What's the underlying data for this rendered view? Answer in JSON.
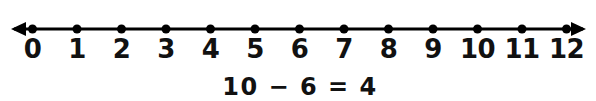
{
  "canvas": {
    "width": 596,
    "height": 101,
    "background": "#ffffff",
    "ink": "#000000"
  },
  "number_line": {
    "name": "number-line",
    "orientation": "horizontal",
    "has_left_arrow": true,
    "has_right_arrow": true,
    "min": 0,
    "max": 12,
    "step": 1,
    "tick_labels": [
      "0",
      "1",
      "2",
      "3",
      "4",
      "5",
      "6",
      "7",
      "8",
      "9",
      "10",
      "11",
      "12"
    ],
    "marked_points": [
      0,
      1,
      2,
      3,
      4,
      5,
      6,
      7,
      8,
      9,
      10,
      11,
      12
    ],
    "geometry": {
      "line_y": 29,
      "left_arrow_tip_x": 11,
      "right_arrow_tip_x": 586,
      "first_dot_x": 32.5,
      "spacing_px": 44.5,
      "dot_radius": 4.5,
      "label_baseline_y": 58
    }
  },
  "equation": {
    "name": "subtraction-equation",
    "text": "10 − 6 = 4",
    "minuend": "10",
    "operator": "−",
    "subtrahend": "6",
    "equals": "=",
    "difference": "4",
    "center_x": 300,
    "baseline_y": 95
  }
}
